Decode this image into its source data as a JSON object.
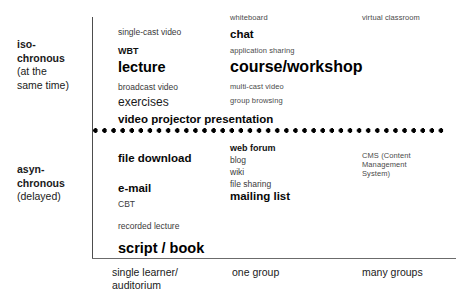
{
  "diagram": {
    "row_labels": [
      {
        "id": "isochronous",
        "bold": "iso-\nchronous",
        "note": "(at the\nsame time)"
      },
      {
        "id": "asynchronous",
        "bold": "asyn-\nchronous",
        "note": "(delayed)"
      }
    ],
    "column_labels": [
      {
        "id": "single-learner",
        "text": "single learner/\nauditorium"
      },
      {
        "id": "one-group",
        "text": "one group"
      },
      {
        "id": "many-groups",
        "text": "many groups"
      }
    ],
    "cells": {
      "iso_single_learner": [
        "single-cast video",
        "WBT",
        "lecture",
        "broadcast video",
        "exercises"
      ],
      "iso_one_group": [
        "whiteboard",
        "chat",
        "application sharing",
        "course/workshop",
        "multi-cast video",
        "group browsing"
      ],
      "iso_many_groups": [
        "virtual classroom"
      ],
      "iso_spanning": [
        "video projector presentation"
      ],
      "async_single_learner": [
        "file download",
        "e-mail",
        "CBT",
        "recorded lecture"
      ],
      "async_one_group": [
        "web forum",
        "blog",
        "wiki",
        "file sharing",
        "mailing list"
      ],
      "async_many_groups": [
        "CMS (Content Management System)"
      ],
      "async_spanning": [
        "script / book"
      ]
    },
    "colors": {
      "background": "#ffffff",
      "text": "#1a1a1a",
      "muted_text": "#4a4a4a",
      "axis_line": "#4d4d4d",
      "base_line": "#6b6b6b",
      "divider_dots": "#000000"
    }
  }
}
